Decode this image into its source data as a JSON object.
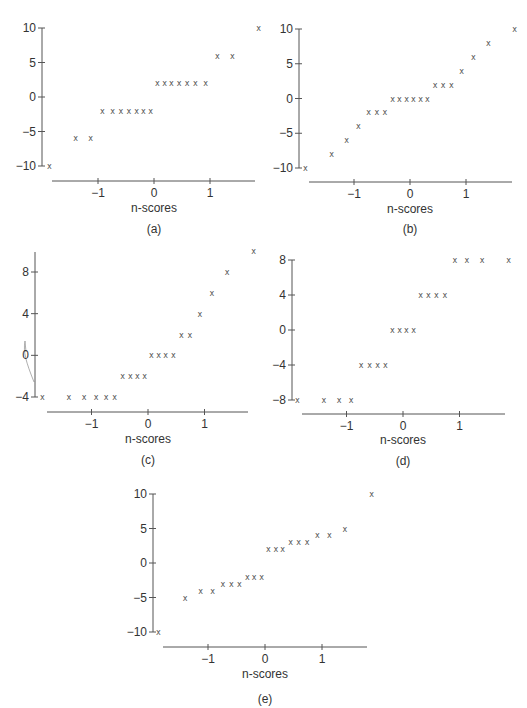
{
  "chart_data": [
    {
      "id": "a",
      "type": "scatter",
      "panel_label": "(a)",
      "xlabel": "n-scores",
      "ylabel": "",
      "marker": "x",
      "x_ticks": [
        -1,
        0,
        1
      ],
      "x_tick_labels": [
        "−1",
        "0",
        "1"
      ],
      "y_ticks": [
        10,
        5,
        0,
        -5,
        -10
      ],
      "y_tick_labels": [
        "10",
        "5",
        "0",
        "−5",
        "−10"
      ],
      "xlim": [
        -1.95,
        1.85
      ],
      "ylim": [
        -10,
        10
      ],
      "grid": false,
      "x": [
        -1.87,
        -1.4,
        -1.13,
        -0.92,
        -0.74,
        -0.59,
        -0.45,
        -0.31,
        -0.19,
        -0.06,
        0.06,
        0.19,
        0.31,
        0.45,
        0.59,
        0.74,
        0.92,
        1.13,
        1.4,
        1.87
      ],
      "y": [
        -10,
        -6,
        -6,
        -2,
        -2,
        -2,
        -2,
        -2,
        -2,
        -2,
        2,
        2,
        2,
        2,
        2,
        2,
        2,
        6,
        6,
        10
      ],
      "layout": {
        "yaxis_x": 42,
        "y_top": 28,
        "y_bottom": 166,
        "xaxis_y": 181,
        "xaxis_x0": 52,
        "xaxis_x1": 255,
        "x_at_neg1": 100,
        "x_at_0": 154,
        "x_at_1": 212,
        "xlabel_y": 212,
        "panel_y": 233
      }
    },
    {
      "id": "b",
      "type": "scatter",
      "panel_label": "(b)",
      "xlabel": "n-scores",
      "ylabel": "",
      "marker": "x",
      "x_ticks": [
        -1,
        0,
        1
      ],
      "x_tick_labels": [
        "−1",
        "0",
        "1"
      ],
      "y_ticks": [
        10,
        5,
        0,
        -5,
        -10
      ],
      "y_tick_labels": [
        "10",
        "5",
        "0",
        "−5",
        "−10"
      ],
      "xlim": [
        -1.95,
        1.85
      ],
      "ylim": [
        -10,
        10
      ],
      "grid": false,
      "x": [
        -1.87,
        -1.4,
        -1.13,
        -0.92,
        -0.74,
        -0.59,
        -0.45,
        -0.31,
        -0.19,
        -0.06,
        0.06,
        0.19,
        0.31,
        0.45,
        0.59,
        0.74,
        0.92,
        1.13,
        1.4,
        1.87
      ],
      "y": [
        -10,
        -8,
        -6,
        -4,
        -2,
        -2,
        -2,
        0,
        0,
        0,
        0,
        0,
        0,
        2,
        2,
        2,
        4,
        6,
        8,
        10
      ],
      "layout": {
        "yaxis_x": 299,
        "y_top": 29,
        "y_bottom": 168,
        "xaxis_y": 182,
        "xaxis_x0": 309,
        "xaxis_x1": 512,
        "x_at_neg1": 356,
        "x_at_0": 410,
        "x_at_1": 468,
        "xlabel_y": 213,
        "panel_y": 233
      }
    },
    {
      "id": "c",
      "type": "scatter",
      "panel_label": "(c)",
      "xlabel": "n-scores",
      "ylabel": "",
      "marker": "x",
      "x_ticks": [
        -1,
        0,
        1
      ],
      "x_tick_labels": [
        "−1",
        "0",
        "1"
      ],
      "y_ticks": [
        8,
        4,
        0,
        -4
      ],
      "y_tick_labels": [
        "8",
        "4",
        "0",
        "−4"
      ],
      "xlim": [
        -1.95,
        1.85
      ],
      "ylim": [
        -4,
        10
      ],
      "grid": false,
      "x": [
        -1.87,
        -1.4,
        -1.13,
        -0.92,
        -0.74,
        -0.59,
        -0.45,
        -0.31,
        -0.19,
        -0.06,
        0.06,
        0.19,
        0.31,
        0.45,
        0.59,
        0.74,
        0.92,
        1.13,
        1.4,
        1.87
      ],
      "y": [
        -4,
        -4,
        -4,
        -4,
        -4,
        -4,
        -2,
        -2,
        -2,
        -2,
        0,
        0,
        0,
        0,
        2,
        2,
        4,
        6,
        8,
        10
      ],
      "layout": {
        "yaxis_x": 35,
        "y_top": 272,
        "y_bottom": 397,
        "y_top_value": 8,
        "y_bottom_value": -4,
        "axis_top": 252,
        "xaxis_y": 412,
        "xaxis_x0": 47,
        "xaxis_x1": 248,
        "x_at_neg1": 93,
        "x_at_0": 148,
        "x_at_1": 206,
        "xlabel_y": 443,
        "panel_y": 464
      }
    },
    {
      "id": "d",
      "type": "scatter",
      "panel_label": "(d)",
      "xlabel": "n-scores",
      "ylabel": "",
      "marker": "x",
      "x_ticks": [
        -1,
        0,
        1
      ],
      "x_tick_labels": [
        "−1",
        "0",
        "1"
      ],
      "y_ticks": [
        8,
        4,
        0,
        -4,
        -8
      ],
      "y_tick_labels": [
        "8",
        "4",
        "0",
        "−4",
        "−8"
      ],
      "xlim": [
        -1.95,
        1.85
      ],
      "ylim": [
        -8,
        8
      ],
      "grid": false,
      "x": [
        -1.87,
        -1.4,
        -1.13,
        -0.92,
        -0.74,
        -0.59,
        -0.45,
        -0.31,
        -0.19,
        -0.06,
        0.06,
        0.19,
        0.31,
        0.45,
        0.59,
        0.74,
        0.92,
        1.13,
        1.4,
        1.87
      ],
      "y": [
        -8,
        -8,
        -8,
        -8,
        -4,
        -4,
        -4,
        -4,
        0,
        0,
        0,
        0,
        4,
        4,
        4,
        4,
        8,
        8,
        8,
        8
      ],
      "layout": {
        "yaxis_x": 292,
        "y_top": 260,
        "y_bottom": 400,
        "xaxis_y": 414,
        "xaxis_x0": 302,
        "xaxis_x1": 505,
        "x_at_neg1": 348,
        "x_at_0": 403,
        "x_at_1": 461,
        "xlabel_y": 444,
        "panel_y": 465
      }
    },
    {
      "id": "e",
      "type": "scatter",
      "panel_label": "(e)",
      "xlabel": "n-scores",
      "ylabel": "",
      "marker": "x",
      "x_ticks": [
        -1,
        0,
        1
      ],
      "x_tick_labels": [
        "−1",
        "0",
        "1"
      ],
      "y_ticks": [
        10,
        5,
        0,
        -5,
        -10
      ],
      "y_tick_labels": [
        "10",
        "5",
        "0",
        "−5",
        "−10"
      ],
      "xlim": [
        -1.95,
        1.85
      ],
      "ylim": [
        -10,
        10
      ],
      "grid": false,
      "x": [
        -1.87,
        -1.4,
        -1.13,
        -0.92,
        -0.74,
        -0.59,
        -0.45,
        -0.31,
        -0.19,
        -0.06,
        0.06,
        0.19,
        0.31,
        0.45,
        0.59,
        0.74,
        0.92,
        1.13,
        1.4,
        1.87
      ],
      "y": [
        -10,
        -5,
        -4,
        -4,
        -3,
        -3,
        -3,
        -2,
        -2,
        -2,
        2,
        2,
        2,
        3,
        3,
        3,
        4,
        4,
        5,
        10
      ],
      "layout": {
        "yaxis_x": 153,
        "y_top": 494,
        "y_bottom": 632,
        "xaxis_y": 647,
        "xaxis_x0": 163,
        "xaxis_x1": 367,
        "x_at_neg1": 210,
        "x_at_0": 265,
        "x_at_1": 324,
        "xlabel_y": 678,
        "panel_y": 703
      }
    }
  ]
}
